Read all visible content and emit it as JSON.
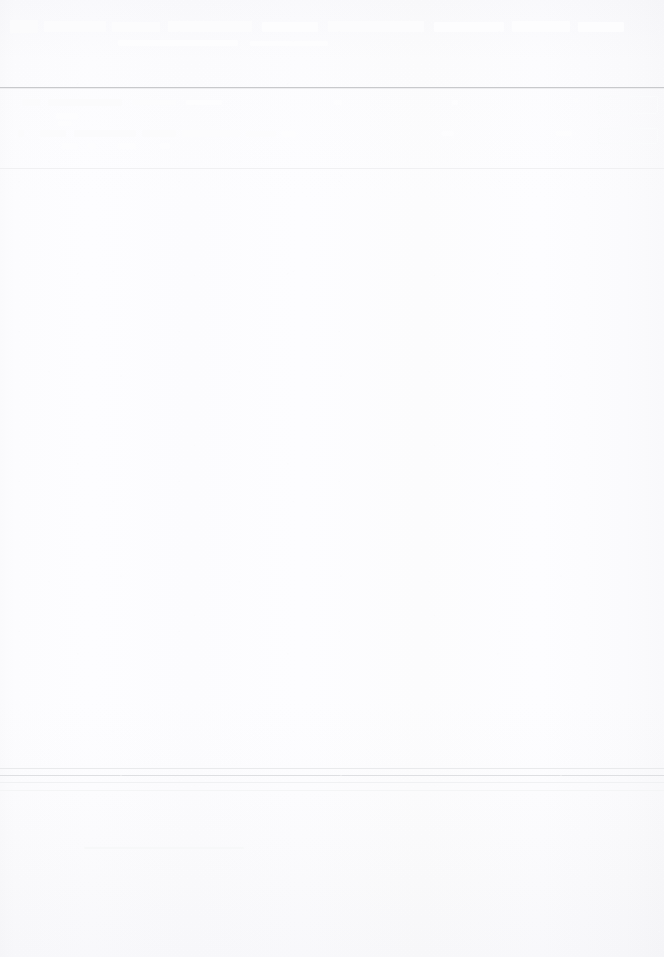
{
  "page": {
    "width_px": 664,
    "height_px": 957,
    "background_color": "#fdfdfe",
    "legibility_note": "No text in this scan is legible at any zoom level; only structural rules and faint glyph traces are resolvable."
  },
  "header": {
    "title": "",
    "title_legible": false,
    "ghost_text_present": true
  },
  "rules": {
    "primary_color": "#c8c9cc",
    "secondary_color": "#f0f0f2",
    "footer_color": "#dedfe2"
  },
  "toolbar_row": {
    "text_rows_legible": false,
    "field_outline_present": true,
    "field_value": "",
    "field_placeholder": ""
  },
  "body": {
    "content": "",
    "content_legible": false
  },
  "footer": {
    "content": "",
    "content_legible": false
  }
}
